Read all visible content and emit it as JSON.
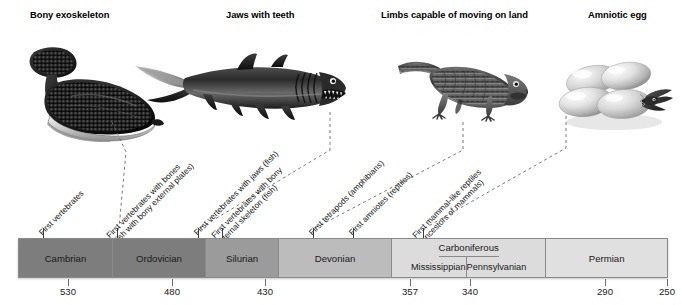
{
  "headers": [
    {
      "label": "Bony exoskeleton",
      "x": 30,
      "y": 9
    },
    {
      "label": "Jaws with teeth",
      "x": 226,
      "y": 9
    },
    {
      "label": "Limbs capable of moving on land",
      "x": 381,
      "y": 9
    },
    {
      "label": "Amniotic egg",
      "x": 588,
      "y": 9
    }
  ],
  "illustrations": [
    {
      "name": "ostracoderm-armored-fish",
      "x": 14,
      "y": 44,
      "w": 160,
      "h": 100
    },
    {
      "name": "placoderm-shark-with-jaws",
      "x": 133,
      "y": 48,
      "w": 215,
      "h": 78
    },
    {
      "name": "tetrapod-amphibian",
      "x": 396,
      "y": 50,
      "w": 135,
      "h": 72
    },
    {
      "name": "amniotic-eggs-with-hatchling-reptile",
      "x": 556,
      "y": 52,
      "w": 120,
      "h": 80
    }
  ],
  "events": [
    {
      "lines": [
        "First vertebrates"
      ],
      "tick_x": 43,
      "label_x": 44,
      "label_y": 228
    },
    {
      "lines": [
        "First vertebrates with bones",
        "(fish with bony external plates)"
      ],
      "tick_x": 117,
      "label_x": 118,
      "label_y": 228
    },
    {
      "lines": [
        "First vertebrates with jaws (fish)"
      ],
      "tick_x": 198,
      "label_x": 199,
      "label_y": 228
    },
    {
      "lines": [
        "First vertebrates with bony",
        "internal skeleton (fish)"
      ],
      "tick_x": 222,
      "label_x": 223,
      "label_y": 228
    },
    {
      "lines": [
        "First tetrapods (amphibians)"
      ],
      "tick_x": 313,
      "label_x": 314,
      "label_y": 228
    },
    {
      "lines": [
        "First amniotes (reptiles)"
      ],
      "tick_x": 353,
      "label_x": 354,
      "label_y": 228
    },
    {
      "lines": [
        "First mammal-like reptiles",
        "(ancestors of mammals)"
      ],
      "tick_x": 423,
      "label_x": 424,
      "label_y": 228
    }
  ],
  "leaders": [
    {
      "name": "leader-ostracoderm",
      "points": "112,122 126,152 119,228"
    },
    {
      "name": "leader-placoderm-jaws",
      "points": "330,112 330,150 200,228"
    },
    {
      "name": "leader-tetrapod",
      "points": "463,122 463,150 315,228"
    },
    {
      "name": "leader-egg",
      "points": "566,116 566,148 425,228"
    }
  ],
  "timeline": {
    "periods": [
      {
        "name": "cambrian",
        "label": "Cambrian",
        "flex": 94,
        "color": "#7d7d7d"
      },
      {
        "name": "ordovician",
        "label": "Ordovician",
        "flex": 93,
        "color": "#7d7d7d"
      },
      {
        "name": "silurian",
        "label": "Silurian",
        "flex": 73,
        "color": "#9b9b9b"
      },
      {
        "name": "devonian",
        "label": "Devonian",
        "flex": 113,
        "color": "#bcbcbc"
      },
      {
        "name": "carboniferous",
        "label": "Carboniferous",
        "flex": 155,
        "color": "#dcdcdc",
        "subs": [
          {
            "name": "mississippian",
            "label": "Mississippian"
          },
          {
            "name": "pennsylvanian",
            "label": "Pennsylvanian"
          }
        ]
      },
      {
        "name": "permian",
        "label": "Permian",
        "flex": 122,
        "color": "#e0e0e0"
      }
    ],
    "axis": [
      {
        "value": "530",
        "x": 68
      },
      {
        "value": "480",
        "x": 172
      },
      {
        "value": "430",
        "x": 265
      },
      {
        "value": "357",
        "x": 410
      },
      {
        "value": "340",
        "x": 470
      },
      {
        "value": "290",
        "x": 605
      },
      {
        "value": "250",
        "x": 667
      }
    ]
  },
  "palette": {
    "dark_gray": "#7d7d7d",
    "mid_gray": "#9b9b9b",
    "light_gray": "#bcbcbc",
    "lighter_gray": "#dcdcdc",
    "lightest_gray": "#e0e0e0",
    "outline": "#8a8a8a"
  }
}
